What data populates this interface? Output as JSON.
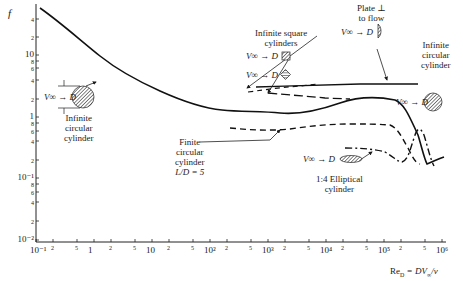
{
  "chart_data": {
    "type": "line",
    "title": "",
    "ylabel": "f",
    "xlabel": "Re_D = DV∞/ν",
    "xscale": "log",
    "yscale": "log",
    "xlim": [
      0.1,
      1000000
    ],
    "ylim": [
      0.01,
      60
    ],
    "grid": false,
    "x_ticks_major": [
      "10^-1",
      "1",
      "10",
      "10^2",
      "10^3",
      "10^4",
      "10^5",
      "10^6"
    ],
    "x_ticks_minor_labels": [
      "2",
      "5"
    ],
    "y_ticks_major": [
      "10^-2",
      "10^-1",
      "1",
      "10"
    ],
    "y_ticks_minor_labels": [
      "2",
      "4",
      "6",
      "8"
    ],
    "series": [
      {
        "name": "Infinite circular cylinder",
        "style": "solid",
        "x": [
          0.12,
          0.2,
          0.5,
          1,
          2,
          5,
          10,
          20,
          50,
          100,
          200,
          500,
          1000,
          2000,
          5000,
          10000,
          20000,
          50000,
          100000,
          200000,
          300000,
          400000,
          500000,
          700000
        ],
        "y": [
          60,
          40,
          20,
          11,
          6.5,
          3.8,
          2.6,
          2.0,
          1.5,
          1.3,
          1.25,
          1.2,
          1.1,
          1.1,
          1.15,
          1.3,
          1.35,
          1.35,
          1.3,
          1.1,
          0.7,
          0.4,
          0.32,
          0.38
        ]
      },
      {
        "name": "Finite circular cylinder L/D = 5",
        "style": "dashed",
        "x": [
          200,
          500,
          1000,
          2000,
          5000,
          10000,
          20000,
          50000,
          100000,
          150000,
          200000,
          300000
        ],
        "y": [
          0.68,
          0.62,
          0.6,
          0.63,
          0.7,
          0.72,
          0.72,
          0.73,
          0.72,
          0.68,
          0.5,
          0.35
        ]
      },
      {
        "name": "Plate ⊥ to flow",
        "style": "solid",
        "x": [
          1000,
          5000,
          10000,
          100000,
          300000
        ],
        "y": [
          2.2,
          2.1,
          2.1,
          2.05,
          2.0
        ]
      },
      {
        "name": "Infinite square cylinders (flat face)",
        "style": "dashed",
        "x": [
          700,
          2000,
          5000,
          10000,
          20000
        ],
        "y": [
          1.9,
          2.1,
          2.25,
          2.3,
          2.3
        ]
      },
      {
        "name": "Infinite square cylinders (diagonal)",
        "style": "long-dashed",
        "x": [
          2000,
          5000,
          10000,
          20000,
          50000
        ],
        "y": [
          1.85,
          1.8,
          1.65,
          1.6,
          1.55
        ]
      },
      {
        "name": "1:4 Elliptical cylinder",
        "style": "dash-dot",
        "x": [
          7000,
          10000,
          20000,
          50000,
          100000,
          150000,
          200000,
          300000,
          500000
        ],
        "y": [
          0.28,
          0.27,
          0.25,
          0.2,
          0.17,
          0.19,
          0.5,
          0.65,
          0.3
        ]
      }
    ],
    "annotations": [
      {
        "text": "Infinite circular cylinder",
        "near_x": 3,
        "near_y": 1.2
      },
      {
        "text": "Infinite square cylinders",
        "near_x": 1500,
        "near_y": 5
      },
      {
        "text": "Plate ⊥ to flow",
        "near_x": 100000,
        "near_y": 12
      },
      {
        "text": "Infinite circular cylinder",
        "near_x": 1000000,
        "near_y": 4
      },
      {
        "text": "Finite circular cylinder L/D = 5",
        "near_x": 100,
        "near_y": 0.4
      },
      {
        "text": "1:4 Elliptical cylinder",
        "near_x": 20000,
        "near_y": 0.1
      }
    ]
  },
  "labels": {
    "y_axis": "f",
    "x_axis": "Re",
    "x_axis_sub": "D",
    "x_axis_rest": " = DV",
    "x_axis_inf": "∞",
    "x_axis_end": "/ν",
    "circ_left_1": "Infinite",
    "circ_left_2": "circular",
    "circ_left_3": "cylinder",
    "square_1": "Infinite square",
    "square_2": "cylinders",
    "plate_1": "Plate ⊥",
    "plate_2": "to flow",
    "circ_right_1": "Infinite",
    "circ_right_2": "circular",
    "circ_right_3": "cylinder",
    "finite_1": "Finite",
    "finite_2": "circular",
    "finite_3": "cylinder",
    "finite_4": "L/D = 5",
    "ellip_1": "1:4 Elliptical",
    "ellip_2": "cylinder",
    "v_inf": "V∞",
    "d": "D"
  },
  "ticks": {
    "y": [
      {
        "t": "4",
        "y": 19,
        "small": true
      },
      {
        "t": "2",
        "y": 37,
        "small": true
      },
      {
        "t": "10",
        "y": 55
      },
      {
        "t": "8",
        "y": 61,
        "small": true
      },
      {
        "t": "6",
        "y": 68,
        "small": true
      },
      {
        "t": "4",
        "y": 80,
        "small": true
      },
      {
        "t": "2",
        "y": 99,
        "small": true
      },
      {
        "t": "1",
        "y": 117
      },
      {
        "t": "8",
        "y": 123,
        "small": true
      },
      {
        "t": "6",
        "y": 131,
        "small": true
      },
      {
        "t": "4",
        "y": 141,
        "small": true
      },
      {
        "t": "2",
        "y": 160,
        "small": true
      },
      {
        "t": "10⁻¹",
        "y": 178
      },
      {
        "t": "8",
        "y": 184,
        "small": true
      },
      {
        "t": "6",
        "y": 192,
        "small": true
      },
      {
        "t": "4",
        "y": 202,
        "small": true
      },
      {
        "t": "2",
        "y": 221,
        "small": true
      },
      {
        "t": "10⁻²",
        "y": 240
      }
    ],
    "x": [
      {
        "t": "10⁻¹",
        "x": 36
      },
      {
        "t": "2",
        "x": 53,
        "small": true
      },
      {
        "t": "5",
        "x": 77,
        "small": true
      },
      {
        "t": "1",
        "x": 94
      },
      {
        "t": "2",
        "x": 111,
        "small": true
      },
      {
        "t": "5",
        "x": 135,
        "small": true
      },
      {
        "t": "10",
        "x": 152
      },
      {
        "t": "2",
        "x": 169,
        "small": true
      },
      {
        "t": "5",
        "x": 193,
        "small": true
      },
      {
        "t": "10²",
        "x": 210
      },
      {
        "t": "2",
        "x": 227,
        "small": true
      },
      {
        "t": "5",
        "x": 251,
        "small": true
      },
      {
        "t": "10³",
        "x": 268
      },
      {
        "t": "2",
        "x": 285,
        "small": true
      },
      {
        "t": "5",
        "x": 309,
        "small": true
      },
      {
        "t": "10⁴",
        "x": 326
      },
      {
        "t": "2",
        "x": 343,
        "small": true
      },
      {
        "t": "5",
        "x": 367,
        "small": true
      },
      {
        "t": "10⁵",
        "x": 384
      },
      {
        "t": "2",
        "x": 401,
        "small": true
      },
      {
        "t": "5",
        "x": 425,
        "small": true
      },
      {
        "t": "10⁶",
        "x": 442
      }
    ]
  }
}
